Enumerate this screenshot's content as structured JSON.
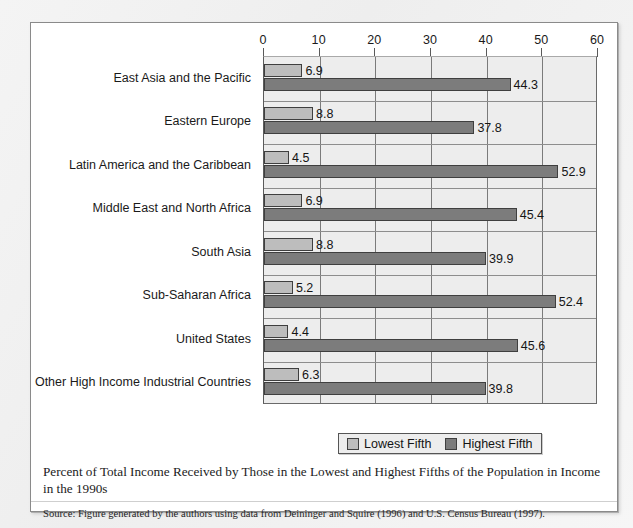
{
  "chart_data": {
    "type": "bar",
    "orientation": "horizontal",
    "title": "",
    "xlabel": "",
    "ylabel": "",
    "xlim": [
      0,
      60
    ],
    "xticks": [
      0,
      10,
      20,
      30,
      40,
      50,
      60
    ],
    "grid": true,
    "legend_position": "bottom-center",
    "categories": [
      "East Asia and the Pacific",
      "Eastern Europe",
      "Latin America and the Caribbean",
      "Middle East and North Africa",
      "South Asia",
      "Sub-Saharan Africa",
      "United States",
      "Other High Income Industrial Countries"
    ],
    "series": [
      {
        "name": "Lowest Fifth",
        "color": "#bdbdbd",
        "values": [
          6.9,
          8.8,
          4.5,
          6.9,
          8.8,
          5.2,
          4.4,
          6.3
        ]
      },
      {
        "name": "Highest Fifth",
        "color": "#7c7c7c",
        "values": [
          44.3,
          37.8,
          52.9,
          45.4,
          39.9,
          52.4,
          45.6,
          39.8
        ]
      }
    ]
  },
  "legend": {
    "items": [
      {
        "label": "Lowest Fifth",
        "swatch": "low"
      },
      {
        "label": "Highest Fifth",
        "swatch": "high"
      }
    ]
  },
  "caption": {
    "text": "Percent of Total Income Received by Those in the Lowest and Highest Fifths of the Population in Income in the 1990s"
  },
  "source": {
    "text": "Source: Figure generated by the authors using data from Deininger and Squire (1996) and U.S. Census Bureau (1997)."
  }
}
